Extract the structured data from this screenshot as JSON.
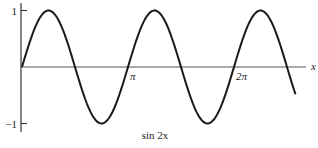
{
  "chart_data": {
    "type": "line",
    "title": "",
    "caption": "sin 2x",
    "xlabel": "x",
    "ylabel": "",
    "function": "sin(2x)",
    "xlim_pi_units": [
      0,
      2.6
    ],
    "ylim": [
      -1,
      1
    ],
    "x_ticks": [
      {
        "value_pi": 1,
        "label": "π"
      },
      {
        "value_pi": 2,
        "label": "2π"
      }
    ],
    "y_ticks": [
      {
        "value": 1,
        "label": "1"
      },
      {
        "value": -1,
        "label": "−1"
      }
    ],
    "series": [
      {
        "name": "sin 2x",
        "x_start_pi": 0,
        "x_end_pi": 2.58,
        "samples": 160
      }
    ],
    "grid": false,
    "legend": "none"
  }
}
